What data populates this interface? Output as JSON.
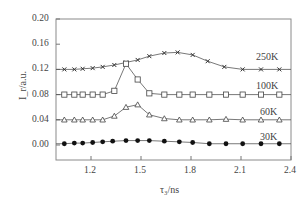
{
  "chart_data": {
    "type": "line",
    "title": "",
    "xlabel": "τ₃/ns",
    "ylabel": "I_r/a.u.",
    "xlim": [
      0.99,
      2.4
    ],
    "ylim": [
      -0.01,
      0.2
    ],
    "x_ticks": [
      "1.2",
      "1.5",
      "1.8",
      "2.1",
      "2.4"
    ],
    "y_ticks": [
      "0.20",
      "0.16",
      "0.12",
      "0.08",
      "0.04",
      "0.00"
    ],
    "grid": false,
    "legend": "inline labels at right",
    "series": [
      {
        "name": "250K",
        "marker": "x",
        "x": [
          1.04,
          1.1,
          1.15,
          1.21,
          1.27,
          1.34,
          1.41,
          1.48,
          1.55,
          1.64,
          1.72,
          1.81,
          1.9,
          2.0,
          2.11,
          2.22,
          2.33
        ],
        "values": [
          0.12,
          0.12,
          0.121,
          0.122,
          0.124,
          0.127,
          0.131,
          0.135,
          0.141,
          0.146,
          0.147,
          0.143,
          0.133,
          0.124,
          0.12,
          0.12,
          0.12
        ]
      },
      {
        "name": "100K",
        "marker": "open-square",
        "x": [
          1.04,
          1.1,
          1.15,
          1.21,
          1.27,
          1.34,
          1.41,
          1.48,
          1.55,
          1.64,
          1.73,
          1.81,
          1.91,
          2.01,
          2.11,
          2.22,
          2.33
        ],
        "values": [
          0.08,
          0.08,
          0.08,
          0.08,
          0.08,
          0.086,
          0.129,
          0.104,
          0.082,
          0.08,
          0.08,
          0.08,
          0.08,
          0.08,
          0.08,
          0.08,
          0.08
        ]
      },
      {
        "name": "60K",
        "marker": "open-triangle",
        "x": [
          1.04,
          1.1,
          1.15,
          1.21,
          1.27,
          1.34,
          1.41,
          1.48,
          1.55,
          1.64,
          1.73,
          1.81,
          1.91,
          2.01,
          2.11,
          2.22,
          2.33
        ],
        "values": [
          0.04,
          0.04,
          0.04,
          0.04,
          0.04,
          0.046,
          0.06,
          0.064,
          0.048,
          0.042,
          0.04,
          0.04,
          0.04,
          0.041,
          0.04,
          0.04,
          0.04
        ]
      },
      {
        "name": "30K",
        "marker": "filled-circle",
        "x": [
          1.04,
          1.1,
          1.15,
          1.21,
          1.27,
          1.33,
          1.41,
          1.48,
          1.55,
          1.64,
          1.73,
          1.81,
          1.91,
          2.01,
          2.11,
          2.22,
          2.33
        ],
        "values": [
          0.002,
          0.003,
          0.003,
          0.004,
          0.005,
          0.006,
          0.007,
          0.007,
          0.007,
          0.006,
          0.005,
          0.004,
          0.002,
          0.002,
          0.002,
          0.002,
          0.002
        ]
      }
    ]
  },
  "labels": {
    "xlabel_text": "τ₃/ns",
    "ylabel_text": "I_r/a.u.",
    "series_250": "250K",
    "series_100": "100K",
    "series_60": "60K",
    "series_30": "30K"
  },
  "colors": {
    "line": "#555555",
    "axis": "#777777"
  }
}
